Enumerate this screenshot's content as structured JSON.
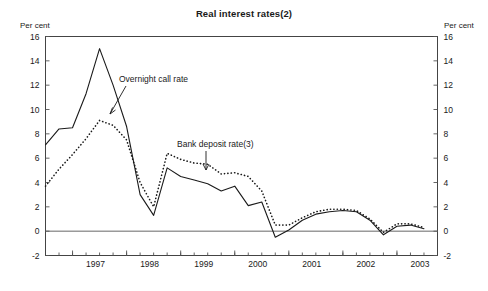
{
  "title": "Real interest rates(2)",
  "axis_unit_left": "Per cent",
  "axis_unit_right": "Per cent",
  "annotations": {
    "overnight": "Overnight call rate",
    "deposit": "Bank deposit rate(3)"
  },
  "chart_data": {
    "type": "line",
    "title": "Real interest rates(2)",
    "xlabel": "",
    "ylabel": "Per cent",
    "ylim": [
      -2,
      16
    ],
    "yticks": [
      -2,
      0,
      2,
      4,
      6,
      8,
      10,
      12,
      14,
      16
    ],
    "xlim": [
      1996.5,
      2003.75
    ],
    "xticks": [
      1997,
      1998,
      1999,
      2000,
      2001,
      2002,
      2003
    ],
    "xtick_labels": [
      "1997",
      "1998",
      "1999",
      "2000",
      "2001",
      "2002",
      "2003"
    ],
    "minor_tick_interval": 0.25,
    "grid": false,
    "legend": "inline-annotations",
    "series": [
      {
        "name": "Overnight call rate",
        "style": "solid",
        "x": [
          1996.5,
          1996.75,
          1997.0,
          1997.25,
          1997.5,
          1997.75,
          1998.0,
          1998.25,
          1998.5,
          1998.75,
          1999.0,
          1999.25,
          1999.5,
          1999.75,
          2000.0,
          2000.25,
          2000.5,
          2000.75,
          2001.0,
          2001.25,
          2001.5,
          2001.75,
          2002.0,
          2002.25,
          2002.5,
          2002.75,
          2003.0,
          2003.25,
          2003.5
        ],
        "y": [
          7.1,
          8.4,
          8.5,
          11.3,
          15.0,
          12.0,
          8.6,
          3.0,
          1.3,
          5.2,
          4.5,
          4.2,
          3.9,
          3.3,
          3.7,
          2.1,
          2.4,
          -0.5,
          0.1,
          0.9,
          1.4,
          1.6,
          1.7,
          1.6,
          0.9,
          -0.3,
          0.4,
          0.5,
          0.2
        ]
      },
      {
        "name": "Bank deposit rate(3)",
        "style": "dotted",
        "x": [
          1996.5,
          1996.75,
          1997.0,
          1997.25,
          1997.5,
          1997.75,
          1998.0,
          1998.25,
          1998.5,
          1998.75,
          1999.0,
          1999.25,
          1999.5,
          1999.75,
          2000.0,
          2000.25,
          2000.5,
          2000.75,
          2001.0,
          2001.25,
          2001.5,
          2001.75,
          2002.0,
          2002.25,
          2002.5,
          2002.75,
          2003.0,
          2003.25,
          2003.5
        ],
        "y": [
          3.7,
          5.1,
          6.3,
          7.6,
          9.1,
          8.7,
          7.5,
          4.0,
          2.0,
          6.4,
          5.9,
          5.6,
          5.5,
          4.7,
          4.8,
          4.5,
          3.3,
          0.5,
          0.5,
          1.1,
          1.6,
          1.8,
          1.8,
          1.7,
          1.0,
          -0.1,
          0.6,
          0.6,
          0.3
        ]
      }
    ],
    "annotations": [
      {
        "text": "Overnight call rate",
        "points_to_series": "Overnight call rate",
        "at_x": 1997.9
      },
      {
        "text": "Bank deposit rate(3)",
        "points_to_series": "Bank deposit rate(3)",
        "at_x": 1999.2
      }
    ]
  }
}
